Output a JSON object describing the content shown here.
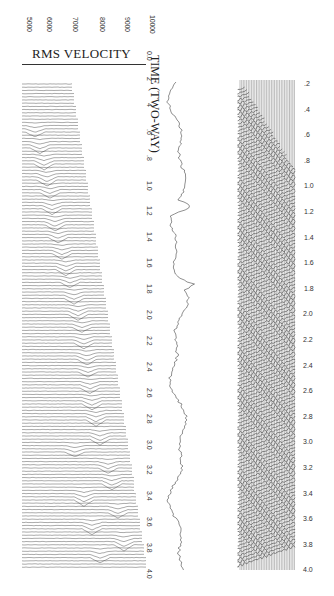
{
  "figure": {
    "velocity_axis": {
      "title": "RMS VELOCITY",
      "ticks": [
        "5000",
        "6000",
        "7000",
        "8000",
        "9000",
        "10000"
      ]
    },
    "time_axis": {
      "title": "TIME (TWO-WAY)",
      "ticks": [
        "0.0",
        "2",
        "4",
        ".6",
        ".8",
        "1.0",
        "1.2",
        "1.4",
        "1.6",
        "1.8",
        "2.0",
        "2.2",
        "2.4",
        "2.6",
        "2.8",
        "3.0",
        "3.2",
        "3.4",
        "3.6",
        "3.8",
        "4.0"
      ]
    },
    "gather_axis": {
      "ticks": [
        ".2",
        ".4",
        ".6",
        ".8",
        "1.0",
        "1.2",
        "1.4",
        "1.6",
        "1.8",
        "2.0",
        "2.2",
        "2.4",
        "2.6",
        "2.8",
        "3.0",
        "3.2",
        "3.4",
        "3.6",
        "3.8",
        "4.0"
      ]
    },
    "panels": [
      "velocity-spectrum",
      "stacked-trace",
      "cmp-gather"
    ],
    "colors": {
      "ink": "#222222",
      "paper": "#ffffff"
    }
  }
}
